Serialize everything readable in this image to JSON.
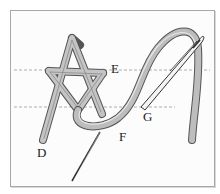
{
  "figure": {
    "labels": {
      "d": "D",
      "e": "E",
      "f": "F",
      "g": "G"
    },
    "guide_lines": [
      {
        "name": "upper-guide",
        "y": 70
      },
      {
        "name": "lower-guide",
        "y": 107
      }
    ],
    "colors": {
      "thread": "#b9b9b9",
      "thread_outline": "#555555",
      "needle": "#333333",
      "guide": "#9a9a9a",
      "frame": "#a8a8a8"
    }
  }
}
